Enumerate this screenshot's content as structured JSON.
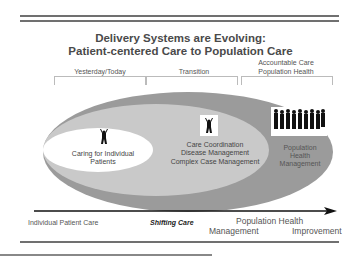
{
  "title": {
    "line1": "Delivery Systems are Evolving:",
    "line2": "Patient-centered Care to Population Care"
  },
  "phases": [
    {
      "label": "Yesterday/Today"
    },
    {
      "label": "Transition"
    },
    {
      "label_line1": "Accountable Care",
      "label_line2": "Population Health"
    }
  ],
  "ellipses": {
    "inner": {
      "line1": "Caring for Individual",
      "line2": "Patients",
      "icon": "single-person-icon",
      "color": "#ffffff"
    },
    "middle": {
      "line1": "Care Coordination",
      "line2": "Disease Management",
      "line3": "Complex Case Management",
      "icon": "single-person-icon",
      "color": "#c9c9c9"
    },
    "outer": {
      "line1": "Population",
      "line2": "Health",
      "line3": "Management",
      "icon": "crowd-icon",
      "color": "#9b9b9b"
    }
  },
  "axis": {
    "left": "Individual Patient Care",
    "middle": "Shifting Care",
    "right_top": "Population Health",
    "right_bottom_left": "Management",
    "right_bottom_right": "Improvement"
  },
  "colors": {
    "rule": "#707070",
    "title": "#4a4a4a",
    "outer_ellipse": "#9b9b9b",
    "middle_ellipse": "#c9c9c9",
    "inner_ellipse": "#ffffff"
  }
}
